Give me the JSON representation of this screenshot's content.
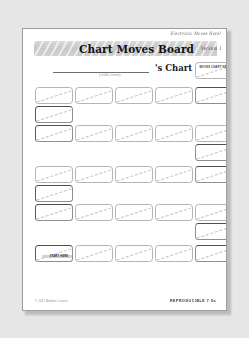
{
  "document": {
    "masthead_note": "Electronic Moves Hotel",
    "title": "Chart Moves Board",
    "version": "Version 1",
    "name_caption": "(child's name)",
    "chart_suffix": "'s Chart",
    "legend_card_label": "MOVES CHART KEY",
    "stamp_label": "START HERE",
    "footer_copyright": "© 2011 Midwest  Lewes",
    "footer_reproducible": "REPRODUCIBLE 7.5a"
  },
  "colors": {
    "app_background": "#e6e6e6",
    "page": "#ffffff",
    "page_border": "#9e9e9e",
    "banner_top": "#d9d9d9",
    "banner_bottom": "#c9c9c9",
    "card_border": "#b4b4b4",
    "card_dash": "#c3c3c3",
    "title_text": "#121212"
  },
  "board": {
    "columns": 5,
    "card_width": 38,
    "card_height": 17,
    "col_x": [
      12,
      52,
      92,
      132,
      172
    ],
    "cards": [
      {
        "name": "legend-card",
        "col": 4,
        "x": 172,
        "y": 33,
        "w": 38,
        "h": 17,
        "kind": "legend"
      },
      {
        "name": "card-r1c0",
        "col": 0,
        "x": 12,
        "y": 58,
        "w": 38,
        "h": 17,
        "kind": "plain"
      },
      {
        "name": "card-r1c1",
        "col": 1,
        "x": 52,
        "y": 58,
        "w": 38,
        "h": 17,
        "kind": "plain"
      },
      {
        "name": "card-r1c2",
        "col": 2,
        "x": 92,
        "y": 58,
        "w": 38,
        "h": 17,
        "kind": "plain"
      },
      {
        "name": "card-r1c3",
        "col": 3,
        "x": 132,
        "y": 58,
        "w": 38,
        "h": 17,
        "kind": "plain"
      },
      {
        "name": "card-r1c4",
        "col": 4,
        "x": 172,
        "y": 58,
        "w": 38,
        "h": 17,
        "kind": "heavy"
      },
      {
        "name": "card-r2c0",
        "col": 0,
        "x": 12,
        "y": 77,
        "w": 38,
        "h": 17,
        "kind": "heavy"
      },
      {
        "name": "card-r3c0",
        "col": 0,
        "x": 12,
        "y": 96,
        "w": 38,
        "h": 17,
        "kind": "heavy"
      },
      {
        "name": "card-r3c1",
        "col": 1,
        "x": 52,
        "y": 96,
        "w": 38,
        "h": 17,
        "kind": "plain"
      },
      {
        "name": "card-r3c2",
        "col": 2,
        "x": 92,
        "y": 96,
        "w": 38,
        "h": 17,
        "kind": "plain"
      },
      {
        "name": "card-r3c3",
        "col": 3,
        "x": 132,
        "y": 96,
        "w": 38,
        "h": 17,
        "kind": "plain"
      },
      {
        "name": "card-r3c4",
        "col": 4,
        "x": 172,
        "y": 96,
        "w": 38,
        "h": 17,
        "kind": "plain"
      },
      {
        "name": "card-r4c4",
        "col": 4,
        "x": 172,
        "y": 115,
        "w": 38,
        "h": 17,
        "kind": "heavy"
      },
      {
        "name": "card-r5c0",
        "col": 0,
        "x": 12,
        "y": 137,
        "w": 38,
        "h": 17,
        "kind": "plain"
      },
      {
        "name": "card-r5c1",
        "col": 1,
        "x": 52,
        "y": 137,
        "w": 38,
        "h": 17,
        "kind": "plain"
      },
      {
        "name": "card-r5c2",
        "col": 2,
        "x": 92,
        "y": 137,
        "w": 38,
        "h": 17,
        "kind": "plain"
      },
      {
        "name": "card-r5c3",
        "col": 3,
        "x": 132,
        "y": 137,
        "w": 38,
        "h": 17,
        "kind": "plain"
      },
      {
        "name": "card-r5c4",
        "col": 4,
        "x": 172,
        "y": 137,
        "w": 38,
        "h": 17,
        "kind": "heavy"
      },
      {
        "name": "card-r6c0",
        "col": 0,
        "x": 12,
        "y": 156,
        "w": 38,
        "h": 17,
        "kind": "heavy"
      },
      {
        "name": "card-r7c0",
        "col": 0,
        "x": 12,
        "y": 175,
        "w": 38,
        "h": 17,
        "kind": "heavy"
      },
      {
        "name": "card-r7c1",
        "col": 1,
        "x": 52,
        "y": 175,
        "w": 38,
        "h": 17,
        "kind": "plain"
      },
      {
        "name": "card-r7c2",
        "col": 2,
        "x": 92,
        "y": 175,
        "w": 38,
        "h": 17,
        "kind": "plain"
      },
      {
        "name": "card-r7c3",
        "col": 3,
        "x": 132,
        "y": 175,
        "w": 38,
        "h": 17,
        "kind": "plain"
      },
      {
        "name": "card-r7c4",
        "col": 4,
        "x": 172,
        "y": 175,
        "w": 38,
        "h": 17,
        "kind": "plain"
      },
      {
        "name": "card-r8c4",
        "col": 4,
        "x": 172,
        "y": 194,
        "w": 38,
        "h": 17,
        "kind": "heavy"
      },
      {
        "name": "card-r9c0",
        "col": 0,
        "x": 12,
        "y": 216,
        "w": 38,
        "h": 17,
        "kind": "stamp"
      },
      {
        "name": "card-r9c1",
        "col": 1,
        "x": 52,
        "y": 216,
        "w": 38,
        "h": 17,
        "kind": "plain"
      },
      {
        "name": "card-r9c2",
        "col": 2,
        "x": 92,
        "y": 216,
        "w": 38,
        "h": 17,
        "kind": "plain"
      },
      {
        "name": "card-r9c3",
        "col": 3,
        "x": 132,
        "y": 216,
        "w": 38,
        "h": 17,
        "kind": "plain"
      },
      {
        "name": "card-r9c4",
        "col": 4,
        "x": 172,
        "y": 216,
        "w": 38,
        "h": 17,
        "kind": "heavy"
      }
    ]
  }
}
